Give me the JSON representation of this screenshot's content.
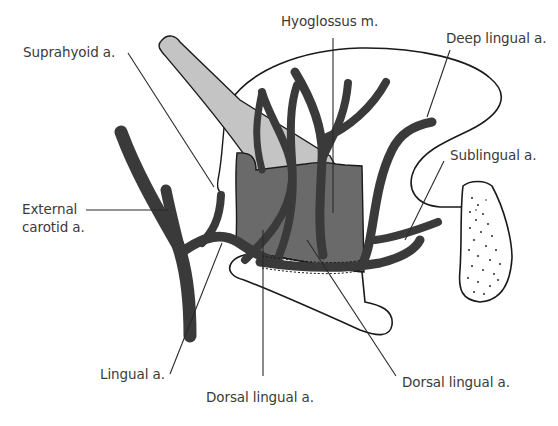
{
  "figure": {
    "colors": {
      "artery": "#3a3a3a",
      "hyoglossus_muscle": "#6a6a6a",
      "styloglossus_muscle": "#c4c4c4",
      "outline": "#1a1a1a",
      "leader_line": "#2a2a2a",
      "label_text": "#3a3a3a",
      "background": "#ffffff"
    },
    "labels": [
      {
        "id": "suprahyoid",
        "text": "Suprahyoid a."
      },
      {
        "id": "hyoglossus",
        "text": "Hyoglossus m."
      },
      {
        "id": "deep_lingual",
        "text": "Deep lingual a."
      },
      {
        "id": "sublingual",
        "text": "Sublingual a."
      },
      {
        "id": "external_carotid",
        "lines": [
          "External",
          "carotid a."
        ]
      },
      {
        "id": "lingual",
        "text": "Lingual a."
      },
      {
        "id": "dorsal_lingual_1",
        "text": "Dorsal lingual a."
      },
      {
        "id": "dorsal_lingual_2",
        "text": "Dorsal lingual a."
      }
    ]
  }
}
